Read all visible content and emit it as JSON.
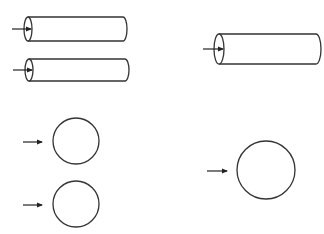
{
  "diagram": {
    "stroke_color": "#333333",
    "background": "#ffffff",
    "cylinders": [
      {
        "id": "small-cylinder-1",
        "left_x": 28,
        "right_x": 123,
        "center_y": 29,
        "radius_y": 12,
        "end_rx": 4,
        "arrow": {
          "x1": 12,
          "x2": 31,
          "y": 29
        }
      },
      {
        "id": "small-cylinder-2",
        "left_x": 29,
        "right_x": 125,
        "center_y": 70,
        "radius_y": 11,
        "end_rx": 4,
        "arrow": {
          "x1": 13,
          "x2": 32,
          "y": 70
        }
      },
      {
        "id": "large-cylinder",
        "left_x": 219,
        "right_x": 316,
        "center_y": 49,
        "radius_y": 15,
        "end_rx": 5,
        "arrow": {
          "x1": 203,
          "x2": 223,
          "y": 49
        }
      }
    ],
    "circles": [
      {
        "id": "small-circle-1",
        "cx": 76,
        "cy": 141,
        "r": 23,
        "arrow": {
          "x1": 23,
          "x2": 42,
          "y": 142
        }
      },
      {
        "id": "small-circle-2",
        "cx": 76,
        "cy": 204,
        "r": 23,
        "arrow": {
          "x1": 23,
          "x2": 42,
          "y": 205
        }
      },
      {
        "id": "large-circle",
        "cx": 266,
        "cy": 170,
        "r": 29,
        "arrow": {
          "x1": 207,
          "x2": 227,
          "y": 171
        }
      }
    ]
  }
}
